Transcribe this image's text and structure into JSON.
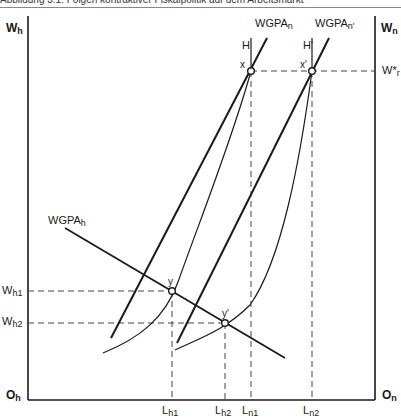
{
  "caption": "Abbildung 3.1: Folgen kontraktiver Fiskalpolitik auf dem Arbeitsmarkt",
  "axes": {
    "left_top": {
      "main": "W",
      "sub": "h"
    },
    "right_top": {
      "main": "W",
      "sub": "n"
    },
    "left_origin": {
      "main": "O",
      "sub": "h"
    },
    "right_origin": {
      "main": "O",
      "sub": "n"
    }
  },
  "curves": {
    "wgpa_n": {
      "main": "WGPA",
      "sub": "n"
    },
    "wgpa_n_prime": {
      "main": "WGPA",
      "sub": "n'"
    },
    "wgpa_h": {
      "main": "WGPA",
      "sub": "h"
    },
    "h": "H",
    "h_prime": "H'"
  },
  "points": {
    "x": "x",
    "x_prime": "x'",
    "y": "y",
    "y_prime": "y'"
  },
  "wage_levels": {
    "w_r_star": {
      "main": "W*",
      "sub": "r"
    },
    "w_h1": {
      "main": "W",
      "sub": "h1"
    },
    "w_h2": {
      "main": "W",
      "sub": "h2"
    }
  },
  "employment_levels": {
    "l_h1": {
      "main": "L",
      "sub": "h1"
    },
    "l_h2": {
      "main": "L",
      "sub": "h2"
    },
    "l_n1": {
      "main": "L",
      "sub": "n1"
    },
    "l_n2": {
      "main": "L",
      "sub": "n2"
    }
  },
  "colors": {
    "line": "#1a1a1a",
    "dash": "#444444"
  }
}
